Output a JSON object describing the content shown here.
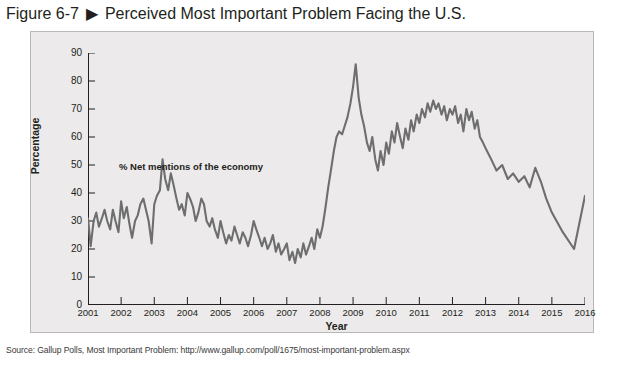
{
  "figure": {
    "number": "Figure 6-7",
    "arrow_icon": "triangle-right-icon",
    "title": "Perceived Most Important Problem Facing the U.S."
  },
  "source": {
    "text": "Source: Gallup Polls, Most Important Problem: http://www.gallup.com/poll/1675/most-important-problem.aspx"
  },
  "colors": {
    "panel_background": "#eceaea",
    "panel_border": "#b9b7b7",
    "series_line": "#6e6e6e",
    "axis": "#231f20",
    "text": "#231f20"
  },
  "chart_data": {
    "type": "line",
    "title": "Perceived Most Important Problem Facing the U.S.",
    "xlabel": "Year",
    "ylabel": "Percentage",
    "xlim": [
      2001,
      2016
    ],
    "ylim": [
      0,
      90
    ],
    "ytick_step": 10,
    "grid": false,
    "legend_position": "inline-annotation",
    "ytick_labels": [
      "0",
      "10",
      "20",
      "30",
      "40",
      "50",
      "60",
      "70",
      "80",
      "90"
    ],
    "xtick_labels": [
      "2001",
      "2002",
      "2003",
      "2004",
      "2005",
      "2006",
      "2007",
      "2008",
      "2009",
      "2010",
      "2011",
      "2012",
      "2013",
      "2014",
      "2015",
      "2016"
    ],
    "series": [
      {
        "name": "% Net mentions of the economy",
        "annotation": "% Net mentions of the economy",
        "color": "#6e6e6e",
        "x": [
          2001.0,
          2001.08,
          2001.17,
          2001.25,
          2001.33,
          2001.42,
          2001.5,
          2001.58,
          2001.67,
          2001.75,
          2001.83,
          2001.92,
          2002.0,
          2002.08,
          2002.17,
          2002.25,
          2002.33,
          2002.42,
          2002.5,
          2002.58,
          2002.67,
          2002.75,
          2002.83,
          2002.92,
          2003.0,
          2003.08,
          2003.17,
          2003.25,
          2003.33,
          2003.42,
          2003.5,
          2003.58,
          2003.67,
          2003.75,
          2003.83,
          2003.92,
          2004.0,
          2004.08,
          2004.17,
          2004.25,
          2004.33,
          2004.42,
          2004.5,
          2004.58,
          2004.67,
          2004.75,
          2004.83,
          2004.92,
          2005.0,
          2005.08,
          2005.17,
          2005.25,
          2005.33,
          2005.42,
          2005.5,
          2005.58,
          2005.67,
          2005.75,
          2005.83,
          2005.92,
          2006.0,
          2006.08,
          2006.17,
          2006.25,
          2006.33,
          2006.42,
          2006.5,
          2006.58,
          2006.67,
          2006.75,
          2006.83,
          2006.92,
          2007.0,
          2007.08,
          2007.17,
          2007.25,
          2007.33,
          2007.42,
          2007.5,
          2007.58,
          2007.67,
          2007.75,
          2007.83,
          2007.92,
          2008.0,
          2008.08,
          2008.17,
          2008.25,
          2008.33,
          2008.42,
          2008.5,
          2008.58,
          2008.67,
          2008.75,
          2008.83,
          2008.92,
          2009.0,
          2009.08,
          2009.17,
          2009.25,
          2009.33,
          2009.42,
          2009.5,
          2009.58,
          2009.67,
          2009.75,
          2009.83,
          2009.92,
          2010.0,
          2010.08,
          2010.17,
          2010.25,
          2010.33,
          2010.42,
          2010.5,
          2010.58,
          2010.67,
          2010.75,
          2010.83,
          2010.92,
          2011.0,
          2011.08,
          2011.17,
          2011.25,
          2011.33,
          2011.42,
          2011.5,
          2011.58,
          2011.67,
          2011.75,
          2011.83,
          2011.92,
          2012.0,
          2012.08,
          2012.17,
          2012.25,
          2012.33,
          2012.42,
          2012.5,
          2012.58,
          2012.67,
          2012.75,
          2012.83,
          2012.92,
          2013.0,
          2013.17,
          2013.33,
          2013.5,
          2013.67,
          2013.83,
          2014.0,
          2014.17,
          2014.33,
          2014.5,
          2014.67,
          2014.83,
          2015.0,
          2015.33,
          2015.67,
          2016.0
        ],
        "values": [
          31,
          21,
          30,
          33,
          28,
          31,
          34,
          30,
          27,
          34,
          30,
          26,
          37,
          31,
          35,
          29,
          24,
          30,
          32,
          36,
          38,
          34,
          30,
          22,
          36,
          39,
          41,
          52,
          45,
          41,
          47,
          43,
          38,
          34,
          36,
          32,
          40,
          38,
          35,
          30,
          33,
          38,
          36,
          30,
          28,
          31,
          27,
          24,
          30,
          26,
          22,
          25,
          23,
          28,
          25,
          22,
          26,
          24,
          21,
          25,
          30,
          27,
          24,
          21,
          24,
          20,
          22,
          25,
          19,
          22,
          18,
          20,
          22,
          16,
          19,
          15,
          20,
          17,
          22,
          18,
          21,
          24,
          20,
          27,
          24,
          28,
          35,
          42,
          48,
          55,
          60,
          62,
          61,
          64,
          67,
          72,
          78,
          86,
          74,
          68,
          64,
          58,
          55,
          60,
          52,
          48,
          55,
          50,
          58,
          54,
          62,
          58,
          65,
          60,
          56,
          63,
          59,
          66,
          62,
          68,
          65,
          70,
          67,
          72,
          69,
          73,
          70,
          72,
          68,
          71,
          66,
          70,
          68,
          71,
          65,
          68,
          62,
          70,
          66,
          69,
          63,
          66,
          60,
          58,
          56,
          52,
          48,
          50,
          45,
          47,
          44,
          46,
          42,
          49,
          44,
          38,
          33,
          26,
          20,
          39
        ]
      }
    ]
  }
}
